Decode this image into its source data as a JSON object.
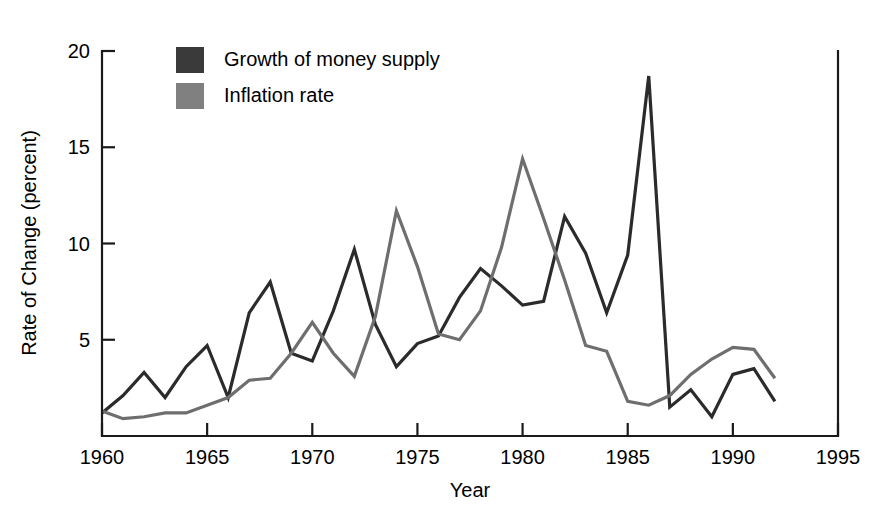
{
  "chart_data": {
    "type": "line",
    "title": "",
    "xlabel": "Year",
    "ylabel": "Rate of Change (percent)",
    "xlim": [
      1960,
      1995
    ],
    "ylim": [
      0,
      20
    ],
    "xticks": [
      1960,
      1965,
      1970,
      1975,
      1980,
      1985,
      1990,
      1995
    ],
    "xtick_labels": [
      "1960",
      "1965",
      "1970",
      "1975",
      "1980",
      "1985",
      "1990",
      "1995"
    ],
    "yticks": [
      5,
      10,
      15,
      20
    ],
    "ytick_labels": [
      "5",
      "10",
      "15",
      "20"
    ],
    "grid": false,
    "legend_position": "top-left-inside",
    "x": [
      1960,
      1961,
      1962,
      1963,
      1964,
      1965,
      1966,
      1967,
      1968,
      1969,
      1970,
      1971,
      1972,
      1973,
      1974,
      1975,
      1976,
      1977,
      1978,
      1979,
      1980,
      1981,
      1982,
      1983,
      1984,
      1985,
      1986,
      1987,
      1988,
      1989,
      1990,
      1991,
      1992
    ],
    "series": [
      {
        "name": "Growth of money supply",
        "color": "#2b2b2b",
        "values": [
          1.2,
          2.1,
          3.3,
          2.0,
          3.6,
          4.7,
          2.0,
          6.4,
          8.0,
          4.3,
          3.9,
          6.5,
          9.7,
          5.8,
          3.6,
          4.8,
          5.2,
          7.2,
          8.7,
          7.8,
          6.8,
          7.0,
          11.4,
          9.5,
          6.4,
          9.4,
          18.7,
          1.5,
          2.4,
          1.0,
          3.2,
          3.5,
          1.8
        ]
      },
      {
        "name": "Inflation rate",
        "color": "#6e6e6e",
        "values": [
          1.3,
          0.9,
          1.0,
          1.2,
          1.2,
          1.6,
          2.0,
          2.9,
          3.0,
          4.3,
          5.9,
          4.3,
          3.1,
          6.2,
          11.7,
          8.8,
          5.3,
          5.0,
          6.5,
          9.8,
          14.4,
          11.3,
          8.1,
          4.7,
          4.4,
          1.8,
          1.6,
          2.1,
          3.2,
          4.0,
          4.6,
          4.5,
          3.0
        ]
      }
    ]
  },
  "legend": {
    "items": [
      {
        "label": "Growth of money supply",
        "swatch_color": "#3a3a3a"
      },
      {
        "label": "Inflation rate",
        "swatch_color": "#808080"
      }
    ]
  }
}
